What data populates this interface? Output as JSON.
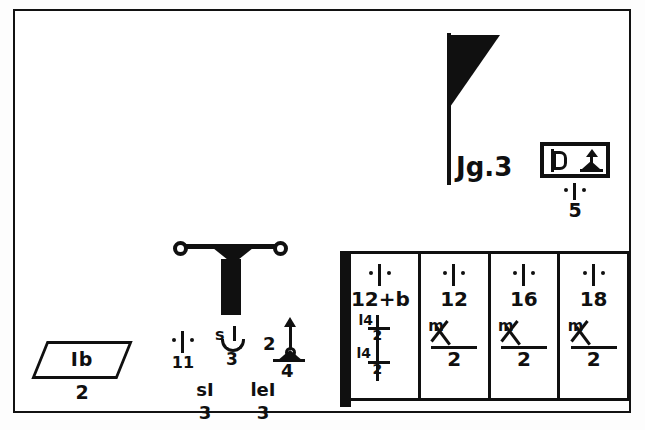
{
  "figure": {
    "caption": "Jg.3",
    "frame_color": "#121212",
    "ink_color": "#101010",
    "background_color": "#ffffff"
  },
  "parallelogram_tag": {
    "label": "Ib",
    "sub_label": "2",
    "shape": "parallelogram"
  },
  "post_assembly": {
    "symbols": {
      "left": {
        "glyph": "dot-stroke-dot",
        "number": "11"
      },
      "middle": {
        "top": "s",
        "bottom": "3"
      },
      "right": {
        "left_number": "2",
        "bottom_number": "4",
        "glyph": "up-arrow"
      }
    },
    "bottom_labels": [
      {
        "top": "sI",
        "number": "3"
      },
      {
        "top": "leI",
        "number": "3"
      }
    ]
  },
  "boxed_pair": {
    "left_glyph": "d-shape",
    "right_glyph": "tree-arrow",
    "tick_glyph": "dot-stroke-dot",
    "number": "5"
  },
  "table": {
    "cells": [
      {
        "glyph": "dot-stroke-dot",
        "number": "12+b",
        "expr_row1": "l4",
        "expr_row2": "2",
        "expr_row3": "l4",
        "expr_row4": "2"
      },
      {
        "glyph": "dot-stroke-dot",
        "number": "12",
        "m_label": "m",
        "denominator": "2"
      },
      {
        "glyph": "dot-stroke-dot",
        "number": "16",
        "m_label": "m",
        "denominator": "2"
      },
      {
        "glyph": "dot-stroke-dot",
        "number": "18",
        "m_label": "m",
        "denominator": "2"
      }
    ]
  }
}
